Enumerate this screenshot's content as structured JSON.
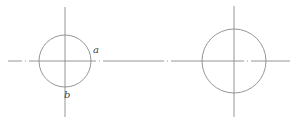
{
  "diagram": {
    "type": "geometry",
    "colors": {
      "stroke": "#8a8a8a",
      "label": "#444444",
      "background": "#ffffff"
    },
    "center_line": {
      "y": 61,
      "x1": 8,
      "x2": 290,
      "style": "dash-dot"
    },
    "circles": [
      {
        "id": "left",
        "center": [
          65,
          61
        ],
        "radius": 26,
        "vertical_axis": {
          "x": 65,
          "y1": 7,
          "y2": 117
        },
        "labels": [
          {
            "text": "a",
            "x": 93,
            "y": 53
          },
          {
            "text": "b",
            "x": 64,
            "y": 98
          }
        ]
      },
      {
        "id": "right",
        "center": [
          234,
          61
        ],
        "radius": 32,
        "vertical_axis": {
          "x": 234,
          "y1": 6,
          "y2": 117
        },
        "labels": []
      }
    ]
  }
}
